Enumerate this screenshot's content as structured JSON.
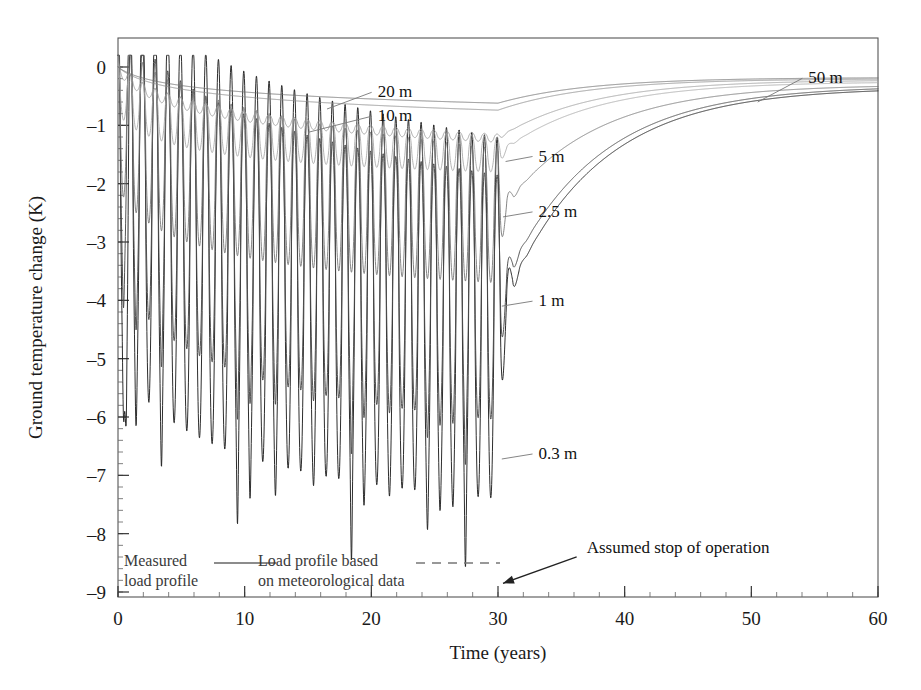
{
  "chart_data": {
    "type": "line",
    "title": "",
    "xlabel": "Time (years)",
    "ylabel": "Ground temperature change (K)",
    "xlim": [
      0,
      60
    ],
    "ylim": [
      -9,
      0.25
    ],
    "xticks": [
      "0",
      "10",
      "20",
      "30",
      "40",
      "50",
      "60"
    ],
    "xtick_values": [
      0,
      10,
      20,
      30,
      40,
      50,
      60
    ],
    "yticks": [
      "0",
      "–1",
      "–2",
      "–3",
      "–4",
      "–5",
      "–6",
      "–7",
      "–8",
      "–9"
    ],
    "ytick_values": [
      0,
      -1,
      -2,
      -3,
      -4,
      -5,
      -6,
      -7,
      -8,
      -9
    ],
    "grid": false,
    "legend_position": "bottom-left-inside",
    "minor_ticks": "x: every 2 years, y: every 0.2 K",
    "operation_stop_year": 30,
    "series": [
      {
        "name": "50 m",
        "label": "50 m",
        "label_x": 54.5,
        "label_y": -0.28,
        "leader_to_x": 50.5,
        "leader_to_y": -0.6,
        "color": "#6f6f6f",
        "amplitude_start": 0.0,
        "amplitude_end": 0.0,
        "mean_at_0": 0.0,
        "mean_at_30": -0.62,
        "mean_at_60": -0.18,
        "description": "Nearly flat shallow drift, drops slowly to about -0.62 K at year 30 then recovers to -0.18 K at year 60"
      },
      {
        "name": "20 m",
        "label": "20 m",
        "label_x": 20.5,
        "label_y": -0.52,
        "leader_to_x": 16.5,
        "leader_to_y": -0.72,
        "color": "#8a8a8a",
        "amplitude_start": 0.0,
        "amplitude_end": 0.0,
        "mean_at_0": 0.0,
        "mean_at_30": -0.74,
        "mean_at_60": -0.2,
        "description": "Smooth decline to about -0.74 K at year 30, recovers after operation stops"
      },
      {
        "name": "10 m",
        "label": "10 m",
        "label_x": 20.5,
        "label_y": -0.93,
        "leader_to_x": 15.0,
        "leader_to_y": -1.12,
        "color": "#9a9a9a",
        "amplitude_start": 0.1,
        "amplitude_end": 0.07,
        "mean_at_0": 0.0,
        "mean_at_30": -1.22,
        "mean_at_60": -0.22,
        "description": "Small ripple superimposed on decline to about -1.2 K at year 30"
      },
      {
        "name": "5 m",
        "label": "5 m",
        "label_x": 33.2,
        "label_y": -1.62,
        "leader_to_x": 30.6,
        "leader_to_y": -1.62,
        "color": "#a5a5a5",
        "amplitude_start": 0.45,
        "amplitude_end": 0.3,
        "mean_at_0": -0.35,
        "mean_at_30": -1.5,
        "mean_at_60": -0.25,
        "description": "Annual oscillation about 0.3-0.45 K amplitude riding a declining mean"
      },
      {
        "name": "2.5 m",
        "label": "2.5 m",
        "label_x": 33.2,
        "label_y": -2.57,
        "leader_to_x": 30.4,
        "leader_to_y": -2.57,
        "color": "#707070",
        "amplitude_start": 1.35,
        "amplitude_end": 1.15,
        "mean_at_0": -0.7,
        "mean_at_30": -2.55,
        "mean_at_60": -0.3,
        "description": "Strong annual oscillation around -2.5 K mean at end of operation"
      },
      {
        "name": "1 m",
        "label": "1 m",
        "label_x": 33.2,
        "label_y": -4.1,
        "leader_to_x": 30.3,
        "leader_to_y": -4.1,
        "color": "#4a4a4a",
        "amplitude_start": 2.3,
        "amplitude_end": 2.1,
        "mean_at_0": -1.0,
        "mean_at_30": -3.95,
        "mean_at_60": -0.32,
        "description": "Large annual oscillation, troughs reach about -6 K"
      },
      {
        "name": "0.3 m",
        "label": "0.3 m",
        "label_x": 33.2,
        "label_y": -6.72,
        "leader_to_x": 30.3,
        "leader_to_y": -6.72,
        "color": "#222222",
        "amplitude_start": 3.4,
        "amplitude_end": 3.1,
        "mean_at_0": -1.3,
        "mean_at_30": -4.3,
        "mean_at_60": -0.35,
        "first_trough": -8.7,
        "description": "Deepest annual oscillation; first winter trough reaches about -8.7 K, later troughs about -6.7 K"
      }
    ],
    "annotations": [
      {
        "name": "assumed-stop-of-operation",
        "text": "Assumed stop of operation",
        "text_x": 37.0,
        "text_y": -8.33,
        "arrow_to_x": 30.0,
        "arrow_to_y": -8.92
      }
    ],
    "legend": [
      {
        "name": "measured-load-profile",
        "text_line1": "Measured",
        "text_line2": "load profile",
        "line_style": "solid"
      },
      {
        "name": "meteorological-load-profile",
        "text_line1": "Load profile based",
        "text_line2": "on meteorological data",
        "line_style": "dashed"
      }
    ]
  }
}
